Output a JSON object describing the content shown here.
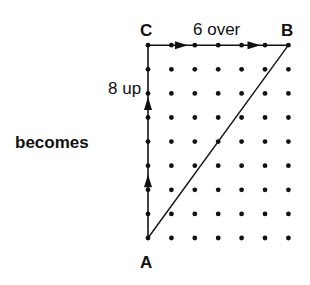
{
  "caption": "becomes",
  "points": {
    "A": {
      "label": "A",
      "grid": [
        0,
        0
      ]
    },
    "B": {
      "label": "B",
      "grid": [
        6,
        8
      ]
    },
    "C": {
      "label": "C",
      "grid": [
        0,
        8
      ]
    }
  },
  "grid": {
    "columns": 7,
    "rows": 9
  },
  "annotations": {
    "horizontal": "6 over",
    "vertical": "8 up"
  },
  "colors": {
    "ink": "#111111",
    "background": "#ffffff"
  }
}
